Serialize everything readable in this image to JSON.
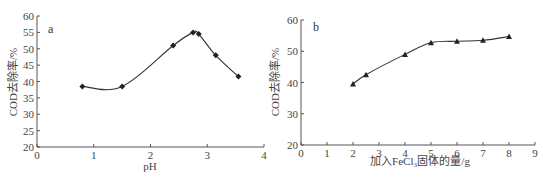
{
  "chart_data": [
    {
      "type": "line",
      "panel_label": "a",
      "title": "",
      "xlabel": "pH",
      "ylabel": "COD去除率/%",
      "xlim": [
        0,
        4
      ],
      "ylim": [
        20,
        60
      ],
      "xticks": [
        "0",
        "1",
        "2",
        "3",
        "4"
      ],
      "yticks": [
        "20",
        "25",
        "30",
        "35",
        "40",
        "45",
        "50",
        "55",
        "60"
      ],
      "marker": "diamond",
      "grid": false,
      "series": [
        {
          "name": "COD去除率",
          "x": [
            0.8,
            1.5,
            2.4,
            2.75,
            2.85,
            3.15,
            3.55
          ],
          "y": [
            38.5,
            38.5,
            51.0,
            55.0,
            54.5,
            48.0,
            41.5
          ]
        }
      ]
    },
    {
      "type": "line",
      "panel_label": "b",
      "title": "",
      "xlabel": "加入FeCl₃固体的量/g",
      "ylabel": "COD去除率/%",
      "xlim": [
        0,
        9
      ],
      "ylim": [
        20,
        60
      ],
      "xticks": [
        "0",
        "1",
        "2",
        "3",
        "4",
        "5",
        "6",
        "7",
        "8",
        "9"
      ],
      "yticks": [
        "20",
        "30",
        "40",
        "50",
        "60"
      ],
      "marker": "triangle",
      "grid": false,
      "series": [
        {
          "name": "COD去除率",
          "x": [
            2,
            2.5,
            4,
            5,
            6,
            7,
            8
          ],
          "y": [
            39.5,
            42.5,
            49.0,
            52.7,
            53.2,
            53.5,
            54.7
          ]
        }
      ]
    }
  ]
}
